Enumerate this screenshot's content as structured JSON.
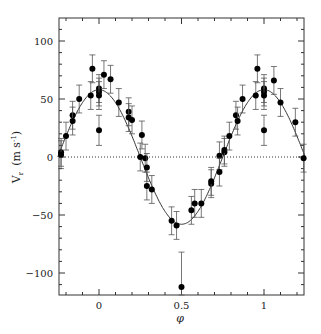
{
  "chart_data": {
    "type": "scatter",
    "title": "",
    "xlabel": "φ",
    "ylabel": "V_r (m s⁻¹)",
    "xlim": [
      -0.25,
      1.25
    ],
    "ylim": [
      -120,
      120
    ],
    "grid": false,
    "legend": null,
    "x_ticks": [
      0,
      0.5,
      1
    ],
    "x_tick_labels": [
      "0",
      "0.5",
      "1"
    ],
    "y_ticks": [
      -100,
      -50,
      0,
      50,
      100
    ],
    "y_tick_labels": [
      "-100",
      "-50",
      "0",
      "50",
      "100"
    ],
    "zero_line": {
      "y": 0,
      "style": "dotted"
    },
    "model_curve": {
      "type": "sinusoid",
      "amplitude": 58,
      "phase_of_max": 0.0,
      "offset": 0,
      "style": "solid"
    },
    "series": [
      {
        "name": "observations",
        "marker": "filled-circle",
        "with_error_bars": true,
        "points": [
          {
            "x": -0.23,
            "y": 4,
            "err": 12
          },
          {
            "x": -0.23,
            "y": 2,
            "err": 12
          },
          {
            "x": -0.2,
            "y": 18,
            "err": 12
          },
          {
            "x": -0.16,
            "y": 36,
            "err": 12
          },
          {
            "x": -0.16,
            "y": 31,
            "err": 12
          },
          {
            "x": -0.12,
            "y": 50,
            "err": 12
          },
          {
            "x": -0.05,
            "y": 53,
            "err": 12
          },
          {
            "x": -0.04,
            "y": 76,
            "err": 12
          },
          {
            "x": 0.0,
            "y": 59,
            "err": 12
          },
          {
            "x": 0.0,
            "y": 56,
            "err": 12
          },
          {
            "x": 0.0,
            "y": 53,
            "err": 12
          },
          {
            "x": 0.0,
            "y": 23,
            "err": 13
          },
          {
            "x": 0.03,
            "y": 71,
            "err": 12
          },
          {
            "x": 0.07,
            "y": 67,
            "err": 12
          },
          {
            "x": 0.12,
            "y": 47,
            "err": 12
          },
          {
            "x": 0.18,
            "y": 39,
            "err": 12
          },
          {
            "x": 0.18,
            "y": 34,
            "err": 12
          },
          {
            "x": 0.2,
            "y": 32,
            "err": 12
          },
          {
            "x": 0.25,
            "y": 0,
            "err": 12
          },
          {
            "x": 0.26,
            "y": 19,
            "err": 12
          },
          {
            "x": 0.28,
            "y": -1,
            "err": 12
          },
          {
            "x": 0.29,
            "y": -9,
            "err": 12
          },
          {
            "x": 0.29,
            "y": -25,
            "err": 12
          },
          {
            "x": 0.32,
            "y": -28,
            "err": 12
          },
          {
            "x": 0.44,
            "y": -55,
            "err": 12
          },
          {
            "x": 0.47,
            "y": -59,
            "err": 12
          },
          {
            "x": 0.5,
            "y": -112,
            "err": 30
          },
          {
            "x": 0.56,
            "y": -46,
            "err": 12
          },
          {
            "x": 0.58,
            "y": -40,
            "err": 12
          },
          {
            "x": 0.62,
            "y": -40,
            "err": 12
          },
          {
            "x": 0.68,
            "y": -23,
            "err": 12
          },
          {
            "x": 0.68,
            "y": -21,
            "err": 12
          },
          {
            "x": 0.73,
            "y": 1,
            "err": 12
          },
          {
            "x": 0.73,
            "y": -13,
            "err": 12
          },
          {
            "x": 0.76,
            "y": 4,
            "err": 12
          },
          {
            "x": 0.76,
            "y": 6,
            "err": 12
          },
          {
            "x": 0.79,
            "y": 18,
            "err": 12
          },
          {
            "x": 0.83,
            "y": 36,
            "err": 12
          },
          {
            "x": 0.84,
            "y": 31,
            "err": 12
          },
          {
            "x": 0.87,
            "y": 50,
            "err": 12
          },
          {
            "x": 0.95,
            "y": 53,
            "err": 12
          },
          {
            "x": 0.96,
            "y": 76,
            "err": 12
          },
          {
            "x": 1.0,
            "y": 59,
            "err": 12
          },
          {
            "x": 1.0,
            "y": 56,
            "err": 12
          },
          {
            "x": 1.0,
            "y": 53,
            "err": 12
          },
          {
            "x": 1.0,
            "y": 23,
            "err": 13
          },
          {
            "x": 1.06,
            "y": 66,
            "err": 12
          },
          {
            "x": 1.1,
            "y": 47,
            "err": 12
          },
          {
            "x": 1.19,
            "y": 30,
            "err": 12
          },
          {
            "x": 1.24,
            "y": -1,
            "err": 12
          }
        ]
      }
    ]
  },
  "axes": {
    "xlabel": "φ",
    "ylabel_main": "V",
    "ylabel_sub": "r",
    "ylabel_units": "(m s",
    "ylabel_exp": "-1",
    "ylabel_close": ")"
  }
}
